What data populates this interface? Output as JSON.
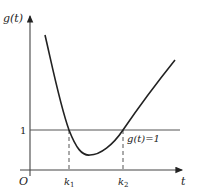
{
  "diagram": {
    "y_axis_label": "g(t)",
    "x_axis_label": "t",
    "origin_label": "O",
    "y_tick_label": "1",
    "x_ticks": [
      {
        "label": "k",
        "sub": "1"
      },
      {
        "label": "k",
        "sub": "2"
      }
    ],
    "line_label": "g(t)=1",
    "colors": {
      "stroke": "#222222",
      "axis": "#444444",
      "guide": "#555555"
    }
  }
}
